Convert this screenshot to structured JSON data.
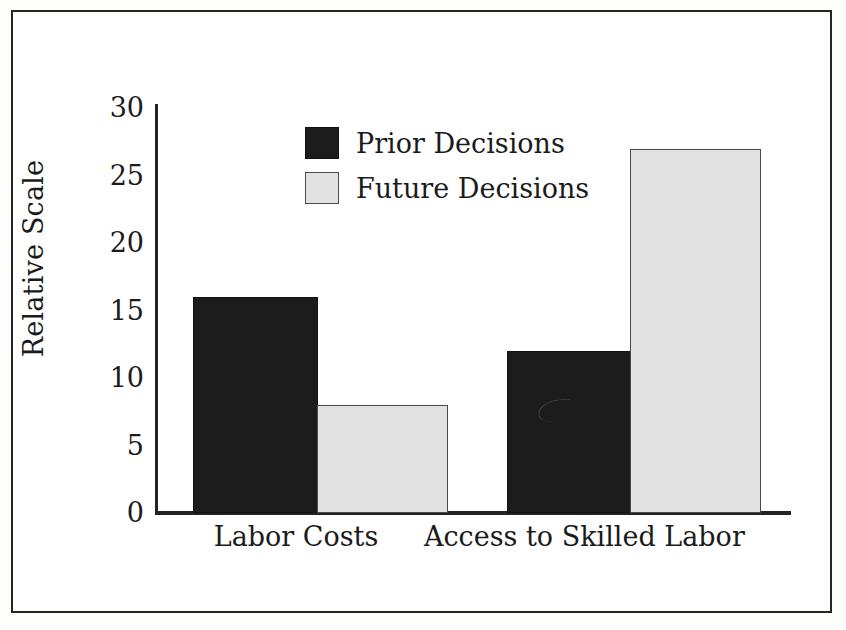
{
  "figure": {
    "background_color": "#ffffff",
    "frame_color": "#262626"
  },
  "legend": {
    "position": "upper-center-left",
    "entries": [
      {
        "label": "Prior Decisions",
        "swatch": "dark",
        "color": "#1c1c1c"
      },
      {
        "label": "Future Decisions",
        "swatch": "light",
        "color": "#e2e2e2"
      }
    ]
  },
  "axes": {
    "y_title": "Relative Scale",
    "y_ticks": [
      "30",
      "25",
      "20",
      "15",
      "10",
      "5",
      "0"
    ],
    "x_labels": [
      "Labor Costs",
      "Access to Skilled Labor"
    ]
  },
  "chart_data": {
    "type": "bar",
    "title": "",
    "subtitle": "",
    "xlabel": "",
    "ylabel": "Relative Scale",
    "categories": [
      "Labor Costs",
      "Access to Skilled Labor"
    ],
    "series": [
      {
        "name": "Prior Decisions",
        "color": "#1c1c1c",
        "values": [
          16,
          12
        ]
      },
      {
        "name": "Future Decisions",
        "color": "#e2e2e2",
        "values": [
          8,
          27
        ]
      }
    ],
    "ylim": [
      0,
      30
    ],
    "ytick_step": 5,
    "ytick_values": [
      0,
      5,
      10,
      15,
      20,
      25,
      30
    ],
    "grid": false,
    "legend_position": "inside-upper-left",
    "annotations": []
  },
  "geometry": {
    "px_per_unit": 13.5,
    "bars": [
      {
        "series": "Prior Decisions",
        "category": "Labor Costs",
        "value": 16,
        "left": 36,
        "width": 125
      },
      {
        "series": "Future Decisions",
        "category": "Labor Costs",
        "value": 8,
        "left": 160,
        "width": 131
      },
      {
        "series": "Prior Decisions",
        "category": "Access to Skilled Labor",
        "value": 12,
        "left": 350,
        "width": 124
      },
      {
        "series": "Future Decisions",
        "category": "Access to Skilled Labor",
        "value": 27,
        "left": 473,
        "width": 131
      }
    ],
    "category_label_positions": [
      {
        "left": 196,
        "width": 200
      },
      {
        "left": 424,
        "width": 304
      }
    ]
  }
}
